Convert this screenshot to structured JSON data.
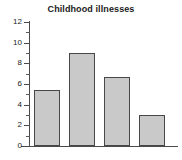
{
  "chart_data": {
    "type": "bar",
    "title": "Childhood illnesses",
    "xlabel": "",
    "ylabel": "",
    "categories": [
      "",
      "",
      "",
      ""
    ],
    "values": [
      5.4,
      9.0,
      6.7,
      3.0
    ],
    "ylim": [
      0,
      12
    ],
    "ytick_labels": [
      "0",
      "2",
      "4",
      "6",
      "8",
      "10",
      "12"
    ],
    "ytick_values": [
      0,
      2,
      4,
      6,
      8,
      10,
      12
    ],
    "yminor_tick_values": [
      1,
      3,
      5,
      7,
      9,
      11
    ],
    "grid": false,
    "legend": false,
    "legend_position": "none",
    "bar_fill_color": "#c9c9c9",
    "bar_edge_color": "#474747",
    "axis_color": "#4a4a4a",
    "background_color": "#ffffff",
    "text_color": "#1a1a1a",
    "xtick_labels_visible": false
  }
}
